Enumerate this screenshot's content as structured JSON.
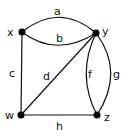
{
  "diagram": {
    "type": "graph",
    "vertices": [
      {
        "id": "x",
        "label": "x"
      },
      {
        "id": "y",
        "label": "y"
      },
      {
        "id": "w",
        "label": "w"
      },
      {
        "id": "z",
        "label": "z"
      }
    ],
    "edges": [
      {
        "id": "a",
        "label": "a",
        "from": "x",
        "to": "y"
      },
      {
        "id": "b",
        "label": "b",
        "from": "x",
        "to": "y"
      },
      {
        "id": "c",
        "label": "c",
        "from": "x",
        "to": "w"
      },
      {
        "id": "d",
        "label": "d",
        "from": "w",
        "to": "y"
      },
      {
        "id": "f",
        "label": "f",
        "from": "y",
        "to": "z"
      },
      {
        "id": "g",
        "label": "g",
        "from": "y",
        "to": "z"
      },
      {
        "id": "h",
        "label": "h",
        "from": "w",
        "to": "z"
      }
    ],
    "colors": {
      "ink": "#111111",
      "background": "#ffffff"
    }
  }
}
